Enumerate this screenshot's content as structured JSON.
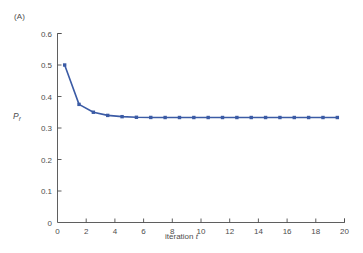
{
  "figure": {
    "panel_label": "(A)",
    "background_color": "#ffffff"
  },
  "chart_data": {
    "type": "line",
    "title": "",
    "panel": "(A)",
    "xlabel": "iteration t",
    "ylabel": "P_f",
    "ylabel_base": "P",
    "ylabel_sub": "f",
    "xlim": [
      0,
      20
    ],
    "ylim": [
      0,
      0.6
    ],
    "xticks": [
      0,
      2,
      4,
      6,
      8,
      10,
      12,
      14,
      16,
      18,
      20
    ],
    "xtick_labels": [
      "0",
      "2",
      "4",
      "6",
      "8",
      "10",
      "12",
      "14",
      "16",
      "18",
      "20"
    ],
    "yticks": [
      0,
      0.1,
      0.2,
      0.3,
      0.4,
      0.5,
      0.6
    ],
    "ytick_labels": [
      "0",
      "0.1",
      "0.2",
      "0.3",
      "0.4",
      "0.5",
      "0.6"
    ],
    "grid": false,
    "legend": false,
    "legend_position": "none",
    "line_color": "#3b5ba5",
    "marker": "square",
    "marker_color": "#3b5ba5",
    "series": [
      {
        "name": "Pf",
        "x": [
          0.5,
          1.5,
          2.5,
          3.5,
          4.5,
          5.5,
          6.5,
          7.5,
          8.5,
          9.5,
          10.5,
          11.5,
          12.5,
          13.5,
          14.5,
          15.5,
          16.5,
          17.5,
          18.5,
          19.5
        ],
        "values": [
          0.5,
          0.375,
          0.35,
          0.34,
          0.336,
          0.334,
          0.3335,
          0.3333,
          0.3333,
          0.3333,
          0.3333,
          0.3333,
          0.3333,
          0.3333,
          0.3333,
          0.3333,
          0.3333,
          0.3333,
          0.3333,
          0.3333
        ]
      }
    ]
  },
  "axes": {
    "line_color": "#4d4d4d",
    "tick_direction": "in"
  }
}
